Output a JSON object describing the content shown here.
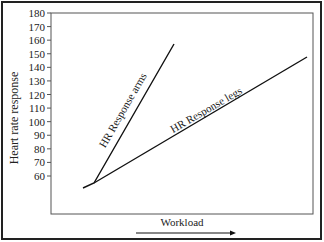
{
  "chart_data": {
    "type": "line",
    "title": "",
    "xlabel": "Workload",
    "ylabel": "Heart rate response",
    "yticks": [
      60,
      70,
      80,
      90,
      100,
      110,
      120,
      130,
      140,
      150,
      160,
      170,
      180
    ],
    "ylim": [
      50,
      180
    ],
    "grid": false,
    "legend": "none (inline line labels)",
    "series": [
      {
        "name": "HR Response arms",
        "points": [
          {
            "x": 0,
            "y": 53
          },
          {
            "x": 1,
            "y": 56
          },
          {
            "x": 9,
            "y": 157
          }
        ]
      },
      {
        "name": "HR Response legs",
        "points": [
          {
            "x": 0,
            "y": 53
          },
          {
            "x": 1,
            "y": 56
          },
          {
            "x": 22,
            "y": 148
          }
        ]
      }
    ],
    "annotations": [
      "Workload arrow pointing right under x-axis"
    ]
  },
  "labels": {
    "ylabel": "Heart rate response",
    "xlabel": "Workload",
    "arms": "HR Response arms",
    "legs": "HR Response legs",
    "ticks": [
      "180",
      "170",
      "160",
      "150",
      "140",
      "130",
      "120",
      "110",
      "100",
      "90",
      "80",
      "70",
      "60"
    ]
  }
}
